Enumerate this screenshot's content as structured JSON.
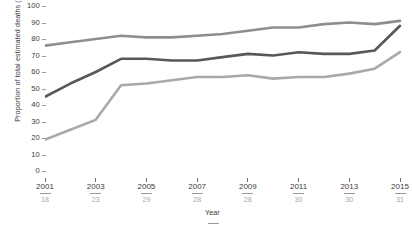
{
  "chart_data": {
    "type": "line",
    "title": "",
    "xlabel": "Year",
    "ylabel": "Proportion of total estimated deaths (%)",
    "ylim": [
      0,
      100
    ],
    "yticks": [
      0,
      10,
      20,
      30,
      40,
      50,
      60,
      70,
      80,
      90,
      100
    ],
    "ytick_labels": [
      "0",
      "10",
      "20",
      "30",
      "40",
      "50",
      "60",
      "70",
      "80",
      "90",
      "100"
    ],
    "grid": false,
    "legend_position": "none",
    "x": [
      2001,
      2002,
      2003,
      2004,
      2005,
      2006,
      2007,
      2008,
      2009,
      2010,
      2011,
      2012,
      2013,
      2014,
      2015
    ],
    "xtick_labels": [
      "2001",
      "2003",
      "2005",
      "2007",
      "2009",
      "2011",
      "2013",
      "2015"
    ],
    "xtick_values": [
      2001,
      2003,
      2005,
      2007,
      2009,
      2011,
      2013,
      2015
    ],
    "xtick_sublabels": [
      "18",
      "23",
      "29",
      "28",
      "28",
      "30",
      "30",
      "31"
    ],
    "series": [
      {
        "name": "upper",
        "color": "#8e8e8e",
        "values": [
          76,
          78,
          80,
          82,
          81,
          81,
          82,
          83,
          85,
          87,
          87,
          89,
          90,
          89,
          91
        ]
      },
      {
        "name": "middle",
        "color": "#585858",
        "values": [
          45,
          53,
          60,
          68,
          68,
          67,
          67,
          69,
          71,
          70,
          72,
          71,
          71,
          73,
          88
        ]
      },
      {
        "name": "lower",
        "color": "#a9a9a9",
        "values": [
          19,
          25,
          31,
          52,
          53,
          55,
          57,
          57,
          58,
          56,
          57,
          57,
          59,
          62,
          72
        ]
      }
    ]
  }
}
